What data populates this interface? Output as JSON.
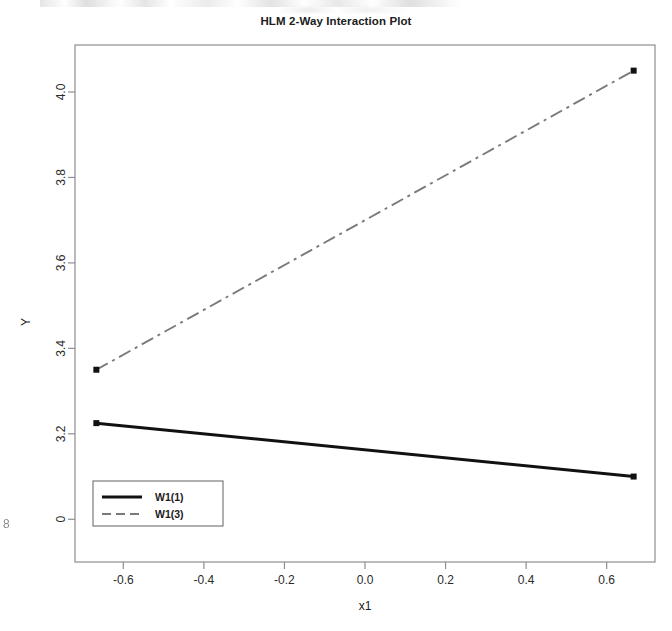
{
  "page": {
    "margin_mark": "8"
  },
  "chart_data": {
    "type": "line",
    "title": "HLM 2-Way Interaction Plot",
    "xlabel": "x1",
    "ylabel": "Y",
    "xlim": [
      -0.72,
      0.72
    ],
    "ylim": [
      2.9,
      4.11
    ],
    "grid": false,
    "legend_position": "bottom-left",
    "x_ticks": [
      -0.6,
      -0.4,
      -0.2,
      0.0,
      0.2,
      0.4,
      0.6
    ],
    "x_tick_labels": [
      "-0.6",
      "-0.4",
      "-0.2",
      "0.0",
      "0.2",
      "0.4",
      "0.6"
    ],
    "y_ticks": [
      3.0,
      3.2,
      3.4,
      3.6,
      3.8,
      4.0
    ],
    "y_tick_labels": [
      "0",
      "3.2",
      "3.4",
      "3.6",
      "3.8",
      "4.0"
    ],
    "x": [
      -0.667,
      0.667
    ],
    "series": [
      {
        "name": "W1(1)",
        "style": "solid",
        "color": "#111111",
        "values": [
          3.225,
          3.1
        ],
        "markers": true
      },
      {
        "name": "W1(3)",
        "style": "dashdot",
        "color": "#7a7a7e",
        "values": [
          3.35,
          4.05
        ],
        "markers": true
      }
    ],
    "legend": [
      "W1(1)",
      "W1(3)"
    ]
  }
}
